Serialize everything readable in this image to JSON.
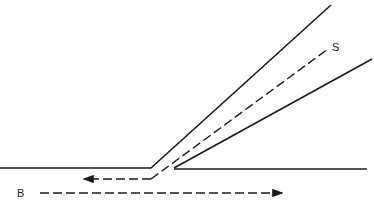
{
  "diagram": {
    "labels": {
      "s": "S",
      "b": "B"
    },
    "colors": {
      "line": "#1a1a1a",
      "background": "#ffffff"
    }
  }
}
